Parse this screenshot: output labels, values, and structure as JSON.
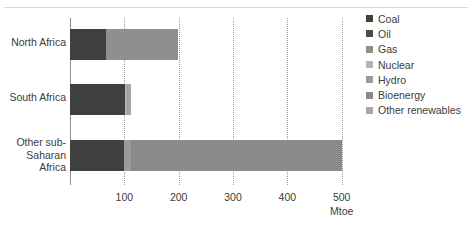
{
  "chart_data": {
    "type": "bar",
    "orientation": "horizontal",
    "stacked": true,
    "title": "",
    "xlabel": "Mtoe",
    "ylabel": "",
    "xlim": [
      0,
      530
    ],
    "xticks": [
      100,
      200,
      300,
      400,
      500
    ],
    "xtick_labels": [
      "100",
      "200",
      "300",
      "400",
      "500"
    ],
    "grid": "vertical-dotted",
    "legend_position": "right",
    "categories": [
      "North Africa",
      "South Africa",
      "Other sub-Saharan Africa"
    ],
    "series": [
      {
        "name": "Coal",
        "color": "#404040",
        "values": [
          67,
          102,
          100
        ]
      },
      {
        "name": "Oil",
        "color": "#4a4a4a",
        "values": [
          0,
          0,
          0
        ]
      },
      {
        "name": "Gas",
        "color": "#8f8f8f",
        "values": [
          131,
          0,
          0
        ]
      },
      {
        "name": "Nuclear",
        "color": "#b3b3b3",
        "values": [
          0,
          3,
          0
        ]
      },
      {
        "name": "Hydro",
        "color": "#9b9b9b",
        "values": [
          0,
          2,
          12
        ]
      },
      {
        "name": "Bioenergy",
        "color": "#8a8a8a",
        "values": [
          0,
          0,
          388
        ]
      },
      {
        "name": "Other renewables",
        "color": "#a6a6a6",
        "values": [
          0,
          5,
          0
        ]
      }
    ]
  },
  "axis": {
    "unit_label": "Mtoe"
  },
  "legend": {
    "items": [
      {
        "label": "Coal"
      },
      {
        "label": "Oil"
      },
      {
        "label": "Gas"
      },
      {
        "label": "Nuclear"
      },
      {
        "label": "Hydro"
      },
      {
        "label": "Bioenergy"
      },
      {
        "label": "Other renewables"
      }
    ]
  }
}
